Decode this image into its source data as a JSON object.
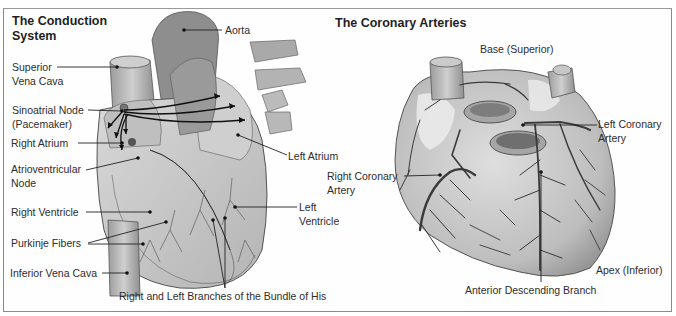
{
  "conduction_panel": {
    "title_line1": "The Conduction",
    "title_line2": "System",
    "labels": {
      "aorta": "Aorta",
      "superior_vena_cava_1": "Superior",
      "superior_vena_cava_2": "Vena Cava",
      "sa_node_1": "Sinoatrial Node",
      "sa_node_2": "(Pacemaker)",
      "right_atrium": "Right Atrium",
      "av_node_1": "Atrioventricular",
      "av_node_2": "Node",
      "right_ventricle": "Right Ventricle",
      "purkinje": "Purkinje Fibers",
      "inferior_vena_cava": "Inferior Vena Cava",
      "left_atrium": "Left Atrium",
      "left_ventricle_1": "Left",
      "left_ventricle_2": "Ventricle",
      "bundle_of_his": "Right and Left Branches of the Bundle of His"
    }
  },
  "coronary_panel": {
    "title": "The Coronary Arteries",
    "labels": {
      "base": "Base (Superior)",
      "left_coronary_1": "Left Coronary",
      "left_coronary_2": "Artery",
      "right_coronary_1": "Right Coronary",
      "right_coronary_2": "Artery",
      "apex": "Apex (Inferior)",
      "anterior_descending": "Anterior Descending Branch"
    }
  },
  "colors": {
    "frame": "#8a8a8a",
    "tissue_light": "#d9d9d9",
    "tissue_mid": "#a8a8a8",
    "tissue_dark": "#6e6e6e",
    "vessel": "#3a3a3a"
  }
}
